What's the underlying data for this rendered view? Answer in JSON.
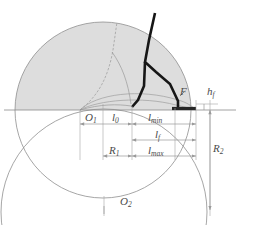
{
  "figure": {
    "type": "engineering-geometry-diagram",
    "colors": {
      "shade_fill": "#dcdcdc",
      "thin_line": "#8c8c8c",
      "dim_line": "#9a9a9a",
      "thick_line": "#161616",
      "label_text": "#4a4a4a",
      "background": "#ffffff"
    }
  },
  "labels": {
    "center_upper": "O",
    "center_upper_sub": "1",
    "center_lower": "O",
    "center_lower_sub": "2",
    "l_zero": "l",
    "l_zero_sub": "0",
    "l_min": "l",
    "l_min_sub": "min",
    "l_f": "l",
    "l_f_sub": "f",
    "l_max": "l",
    "l_max_sub": "max",
    "r_one": "R",
    "r_one_sub": "1",
    "r_two": "R",
    "r_two_sub": "2",
    "h_f": "h",
    "h_f_sub": "f",
    "point_f": "F"
  },
  "dimension_chains": [
    {
      "name": "row-1",
      "segments": [
        "l_0",
        "l_min"
      ],
      "y": 124
    },
    {
      "name": "row-2",
      "segments": [
        "l_f"
      ],
      "y": 140
    },
    {
      "name": "row-3",
      "segments": [
        "R_1",
        "l_max"
      ],
      "y": 156
    },
    {
      "name": "vertical-right",
      "segments": [
        "R_2"
      ],
      "x": 210
    },
    {
      "name": "feed-height",
      "segments": [
        "h_f"
      ],
      "x": 204
    }
  ],
  "geometry": {
    "circle_1": {
      "cx": 103,
      "cy": 110,
      "r": 88,
      "shaded": true
    },
    "circle_2": {
      "cx": 104,
      "cy": 212,
      "r": 103,
      "shaded": false
    },
    "arc_inner": {
      "note": "thin arc band just above the datum line"
    },
    "datum_line_y": 110,
    "origin_x": 80,
    "tick_x_positions": [
      80,
      103,
      175,
      196
    ]
  }
}
